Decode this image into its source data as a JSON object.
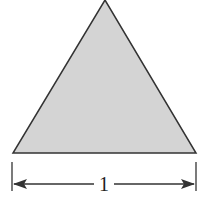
{
  "diagram": {
    "shape": "triangle",
    "fill_color": "#d4d4d4",
    "stroke_color": "#333333",
    "dimension": {
      "label": "1",
      "orientation": "horizontal",
      "arrows": "both"
    }
  }
}
